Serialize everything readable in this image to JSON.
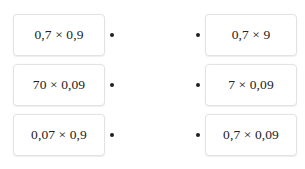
{
  "widget": {
    "type": "matching-exercise",
    "row_count": 3,
    "accent_color": "#1f1f1f",
    "card_border_color": "#e3e3e3",
    "card_background": "#ffffff",
    "text_color": "#222222"
  },
  "rows": [
    {
      "left": {
        "expression": "0,7 × 0,9"
      },
      "right": {
        "expression": "0,7 × 9"
      }
    },
    {
      "left": {
        "expression": "70 × 0,09"
      },
      "right": {
        "expression": "7 × 0,09"
      }
    },
    {
      "left": {
        "expression": "0,07 × 0,9"
      },
      "right": {
        "expression": "0,7 × 0,09"
      }
    }
  ]
}
